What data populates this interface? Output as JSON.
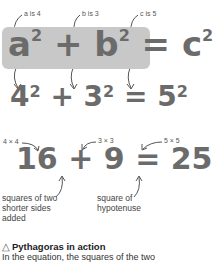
{
  "formula": {
    "general": {
      "a": "a",
      "b": "b",
      "c": "c",
      "exp": "2",
      "plus": "+",
      "equals": "="
    },
    "substituted": {
      "a": "4",
      "b": "3",
      "c": "5",
      "exp": "2",
      "plus": "+",
      "equals": "="
    },
    "evaluated": {
      "a2": "16",
      "b2": "9",
      "c2": "25",
      "plus": "+",
      "equals": "="
    }
  },
  "labels": {
    "a_is": "a is 4",
    "b_is": "b is 3",
    "c_is": "c is 5",
    "a_sq": "4 × 4",
    "b_sq": "3 × 3",
    "c_sq": "5 × 5",
    "sum_note": [
      "squares of two",
      "shorter sides",
      "added"
    ],
    "hyp_note": [
      "square of",
      "hypotenuse"
    ]
  },
  "caption": {
    "icon": "triangle-icon",
    "title": "Pythagoras in action",
    "body": "In the equation, the squares of the two"
  },
  "colors": {
    "box": "#c8c8c8",
    "formula_text": "#6b6b6b",
    "arrow": "#555555"
  }
}
